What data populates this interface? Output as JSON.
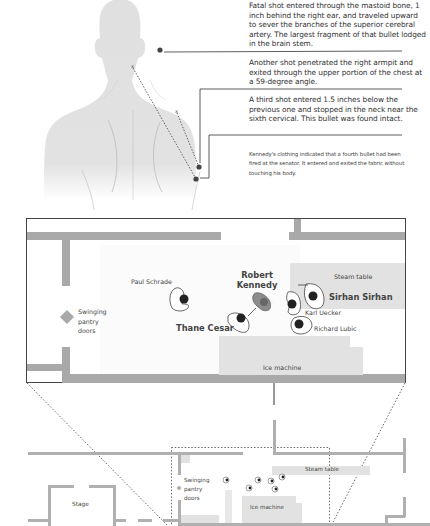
{
  "autopsy": {
    "notes": [
      {
        "id": "fatal",
        "text": "Fatal shot entered through the mastoid bone, 1 inch behind the right ear, and traveled upward to sever the branches of the superior cerebral artery. The largest fragment of that bullet lodged in the brain stem."
      },
      {
        "id": "armpit",
        "text": "Another shot penetrated the right armpit and exited through the upper portion of the chest at a 59-degree angle."
      },
      {
        "id": "third",
        "text": "A third shot entered 1.5 inches below the previous one and stopped in the neck near the sixth cervical. This bullet was found intact."
      },
      {
        "id": "fourth",
        "text": "Kennedy's clothing indicated that a fourth bullet had been fired at the senator. It entered and exited the fabric without touching his body."
      }
    ],
    "markers": {
      "exit": "x"
    }
  },
  "pantry_detail": {
    "people": [
      {
        "id": "paul-schrade",
        "name": "Paul Schrade"
      },
      {
        "id": "robert-kennedy",
        "name_line1": "Robert",
        "name_line2": "Kennedy"
      },
      {
        "id": "thane-cesar",
        "name": "Thane Cesar"
      },
      {
        "id": "sirhan-sirhan",
        "name": "Sirhan Sirhan"
      },
      {
        "id": "karl-uecker",
        "name": "Karl Uecker"
      },
      {
        "id": "richard-lubic",
        "name": "Richard Lubic"
      }
    ],
    "fixtures": {
      "steam_table": "Steam table",
      "ice_machine": "Ice machine",
      "doors_line1": "Swinging",
      "doors_line2": "pantry",
      "doors_line3": "doors"
    }
  },
  "overview_map": {
    "stage": "Stage",
    "doors_line1": "Swinging",
    "doors_line2": "pantry",
    "doors_line3": "doors",
    "steam_table": "Steam table",
    "ice_machine": "Ice machine"
  },
  "colors": {
    "silhouette": "#e0e0e0",
    "wall": "#a9a9a9",
    "fixture": "#e2e2e2",
    "kennedy": "#8c8c8c",
    "line": "#333333"
  }
}
